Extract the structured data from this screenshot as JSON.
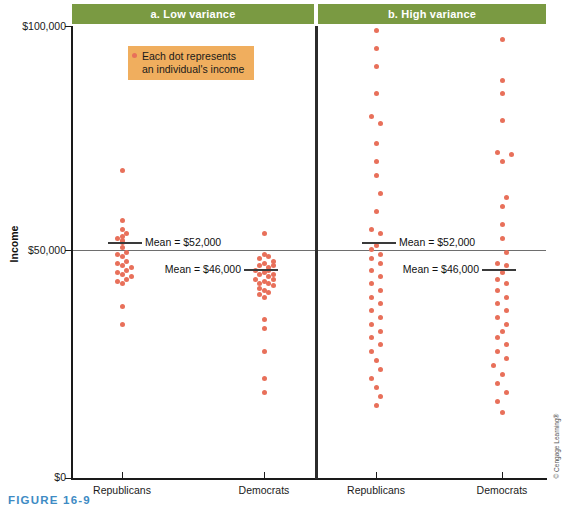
{
  "figure": {
    "caption": "FIGURE 16-9",
    "credit": "© Cengage Learning®",
    "caption_color": "#3e8bc4"
  },
  "legend": {
    "line1": "Each dot represents",
    "line2": "an individual's income",
    "box_color": "#f0ae5e",
    "dot_color": "#e8705a"
  },
  "axes": {
    "y_title": "Income",
    "y_ticks": [
      {
        "label": "$100,000",
        "value": 100000
      },
      {
        "label": "$50,000",
        "value": 50000
      },
      {
        "label": "$0",
        "value": 0
      }
    ],
    "x_ticks": [
      {
        "label": "Republicans"
      },
      {
        "label": "Democrats"
      },
      {
        "label": "Republicans"
      },
      {
        "label": "Democrats"
      }
    ]
  },
  "panels": [
    {
      "title": "a. Low variance",
      "header_color": "#7a9a42"
    },
    {
      "title": "b. High variance",
      "header_color": "#7a9a42"
    }
  ],
  "means": [
    {
      "label": "Mean = $52,000",
      "value": 52000,
      "group": "Republicans",
      "panel": "a. Low variance"
    },
    {
      "label": "Mean = $46,000",
      "value": 46000,
      "group": "Democrats",
      "panel": "a. Low variance"
    },
    {
      "label": "Mean = $52,000",
      "value": 52000,
      "group": "Republicans",
      "panel": "b. High variance"
    },
    {
      "label": "Mean = $46,000",
      "value": 46000,
      "group": "Democrats",
      "panel": "b. High variance"
    }
  ],
  "chart_data": {
    "type": "scatter",
    "xlabel": "",
    "ylabel": "Income",
    "ylim": [
      0,
      100000
    ],
    "yticks": [
      0,
      50000,
      100000
    ],
    "grid": "single horizontal gridline at $50,000",
    "legend": "Each dot represents an individual's income",
    "dot_color": "#e8705a",
    "panels": [
      {
        "name": "a. Low variance",
        "groups": [
          {
            "name": "Republicans",
            "mean": 52000,
            "values": [
              68000,
              57000,
              55000,
              54000,
              53500,
              53000,
              52500,
              52000,
              51000,
              50000,
              49500,
              49000,
              48000,
              47500,
              47000,
              46500,
              46000,
              45500,
              45000,
              44500,
              44000,
              43500,
              43000,
              38000,
              34000
            ],
            "jitter": [
              0,
              0,
              0,
              1,
              0,
              -1,
              0,
              0,
              0,
              1,
              -1,
              0,
              1,
              -1,
              0,
              2,
              1,
              -1,
              0,
              2,
              1,
              -1,
              0,
              0,
              0
            ]
          },
          {
            "name": "Democrats",
            "mean": 46000,
            "values": [
              54000,
              49500,
              49000,
              48500,
              48000,
              47500,
              47000,
              47000,
              46500,
              46000,
              46000,
              45500,
              45000,
              45000,
              44500,
              44000,
              44000,
              43500,
              43000,
              43000,
              42500,
              42000,
              41500,
              41000,
              40500,
              40000,
              35000,
              33000,
              28000,
              22000,
              19000
            ],
            "jitter": [
              0,
              0,
              1,
              -1,
              2,
              0,
              -1,
              2,
              1,
              -2,
              1,
              0,
              2,
              -1,
              1,
              -2,
              2,
              0,
              -1,
              1,
              2,
              -1,
              0,
              1,
              -1,
              0,
              0,
              0,
              0,
              0,
              0
            ]
          }
        ]
      },
      {
        "name": "b. High variance",
        "groups": [
          {
            "name": "Republicans",
            "mean": 52000,
            "values": [
              99000,
              95000,
              91000,
              85000,
              80000,
              78500,
              74000,
              70000,
              67000,
              63000,
              59000,
              55000,
              54000,
              51500,
              50500,
              49500,
              48500,
              47500,
              46000,
              44500,
              43000,
              41500,
              40000,
              38500,
              37000,
              35500,
              34000,
              32500,
              31000,
              29500,
              28000,
              26000,
              24000,
              22000,
              20000,
              18000,
              16000
            ],
            "jitter": [
              0,
              0,
              0,
              0,
              -1,
              1,
              0,
              0,
              0,
              1,
              0,
              -1,
              1,
              0,
              -1,
              1,
              -1,
              1,
              -1,
              1,
              -1,
              1,
              -1,
              1,
              -1,
              1,
              -1,
              1,
              -1,
              1,
              -1,
              0,
              1,
              -1,
              0,
              1,
              0
            ]
          },
          {
            "name": "Democrats",
            "mean": 46000,
            "values": [
              97000,
              88000,
              85000,
              79000,
              72000,
              71500,
              70000,
              62000,
              60000,
              56000,
              53000,
              50000,
              47500,
              47000,
              45500,
              44000,
              43000,
              41500,
              40000,
              38500,
              37000,
              35500,
              34000,
              32500,
              31000,
              29500,
              28000,
              26500,
              25000,
              23000,
              21000,
              19000,
              17000,
              14500
            ],
            "jitter": [
              0,
              0,
              0,
              0,
              -1,
              2,
              0,
              1,
              0,
              0,
              0,
              1,
              -1,
              1,
              0,
              -1,
              1,
              -1,
              1,
              -1,
              1,
              -1,
              1,
              0,
              -1,
              1,
              -1,
              1,
              -2,
              0,
              -1,
              1,
              -1,
              0
            ]
          }
        ]
      }
    ]
  }
}
